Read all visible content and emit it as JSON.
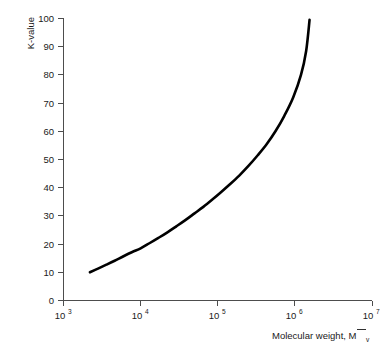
{
  "chart_data": {
    "type": "line",
    "title": "",
    "xlabel": "Molecular weight, M̄v",
    "xlabel_main": "Molecular weight, M",
    "xlabel_sub": "v",
    "ylabel": "K-value",
    "xscale": "log",
    "yscale": "linear",
    "xlim": [
      1000,
      10000000
    ],
    "ylim": [
      0,
      100
    ],
    "grid": false,
    "legend": null,
    "x_tick_labels": [
      "10 3",
      "10 4",
      "10 5",
      "10 6",
      "10 7"
    ],
    "x_tick_bases": [
      "10",
      "10",
      "10",
      "10",
      "10"
    ],
    "x_tick_exponents": [
      "3",
      "4",
      "5",
      "6",
      "7"
    ],
    "x_tick_values": [
      1000,
      10000,
      100000,
      1000000,
      10000000
    ],
    "y_tick_labels": [
      "0",
      "10",
      "20",
      "30",
      "40",
      "50",
      "60",
      "70",
      "80",
      "90",
      "100"
    ],
    "y_tick_values": [
      0,
      10,
      20,
      30,
      40,
      50,
      60,
      70,
      80,
      90,
      100
    ],
    "series": [
      {
        "name": "K-value vs molecular weight",
        "color": "#000000",
        "x": [
          2200,
          2800,
          3600,
          4600,
          6000,
          7800,
          10000,
          13000,
          17000,
          22000,
          29000,
          38000,
          50000,
          65000,
          85000,
          110000,
          145000,
          190000,
          250000,
          330000,
          430000,
          560000,
          730000,
          950000,
          1200000,
          1400000,
          1550000
        ],
        "y": [
          10.0,
          11.3,
          12.7,
          14.1,
          15.7,
          17.2,
          18.5,
          20.3,
          22.2,
          24.1,
          26.3,
          28.5,
          30.9,
          33.2,
          35.8,
          38.4,
          41.3,
          44.3,
          47.7,
          51.5,
          55.4,
          60.0,
          65.5,
          72.0,
          80.0,
          88.5,
          99.5
        ]
      }
    ],
    "annotations": []
  },
  "figure": {
    "background_color": "#ffffff",
    "axis_color": "#4d4d4d",
    "text_color": "#1a1a1a",
    "curve_color": "#000000"
  }
}
